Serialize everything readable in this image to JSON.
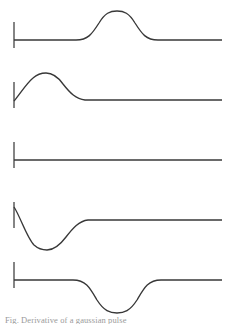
{
  "figure": {
    "title": "",
    "background_color": "#ffffff",
    "line_color": "#383838",
    "tick_color": "#4a4a4a",
    "width": 235,
    "height": 324,
    "caption_clipped": "Fig. Derivative of a gaussian pulse"
  },
  "chart_data": {
    "type": "line",
    "title": "",
    "subtitle": "",
    "xlabel": "",
    "ylabel": "",
    "grid": false,
    "legend": "none",
    "panels_count": 5,
    "shared_x_range": [
      14,
      222
    ],
    "series": [
      {
        "name": "panel-1-gaussian-pulse",
        "panel": 1,
        "baseline_y": 40,
        "tick_x": 14,
        "tick_y_top": 22,
        "tick_y_bottom": 48,
        "shape": "positive-gaussian-bump",
        "extremum": {
          "x": 117,
          "y": 11,
          "type": "peak"
        },
        "amplitude_px": 29,
        "onset_x": 75,
        "offset_x": 160,
        "values_note": "flat baseline, symmetric upward gaussian centered near x=117, returns to baseline"
      },
      {
        "name": "panel-2-rising-decay",
        "panel": 2,
        "baseline_y": 100,
        "tick_x": 14,
        "tick_y_top": 82,
        "tick_y_bottom": 108,
        "shape": "rise-then-decay-to-baseline",
        "start_point": {
          "x": 14,
          "y": 101
        },
        "extremum": {
          "x": 45,
          "y": 73,
          "type": "peak"
        },
        "amplitude_px": 27,
        "settle_x": 92,
        "values_note": "starts at baseline at tick, rises steeply to peak near x=45, decays back to baseline by x=92"
      },
      {
        "name": "panel-3-flat-baseline",
        "panel": 3,
        "baseline_y": 160,
        "tick_x": 14,
        "tick_y_top": 142,
        "tick_y_bottom": 168,
        "shape": "flat-line",
        "extremum": null,
        "amplitude_px": 0,
        "values_note": "perfectly flat horizontal line, zero amplitude"
      },
      {
        "name": "panel-4-falling-recovery",
        "panel": 4,
        "baseline_y": 220,
        "tick_x": 14,
        "tick_y_top": 202,
        "tick_y_bottom": 228,
        "shape": "dip-then-recover-to-baseline",
        "start_point": {
          "x": 14,
          "y": 207
        },
        "extremum": {
          "x": 46,
          "y": 250,
          "type": "trough"
        },
        "amplitude_px": -30,
        "settle_x": 96,
        "values_note": "starts slightly above baseline at tick, dips steeply to trough near x=46, recovers to baseline by x=96"
      },
      {
        "name": "panel-5-inverted-gaussian-pulse",
        "panel": 5,
        "baseline_y": 280,
        "tick_x": 14,
        "tick_y_top": 262,
        "tick_y_bottom": 288,
        "shape": "negative-gaussian-dip",
        "extremum": {
          "x": 117,
          "y": 313,
          "type": "trough"
        },
        "amplitude_px": -33,
        "onset_x": 72,
        "offset_x": 163,
        "values_note": "flat baseline, symmetric downward gaussian centered near x=117, returns to baseline"
      }
    ]
  }
}
